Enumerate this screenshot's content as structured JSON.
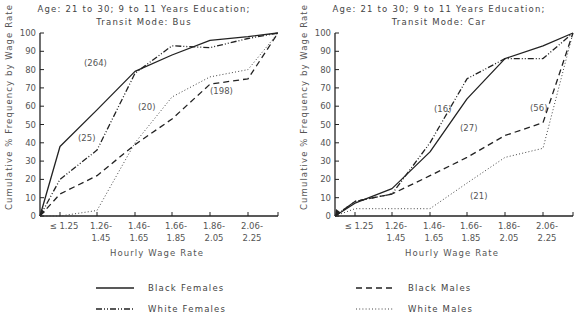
{
  "chart_data": [
    {
      "type": "line",
      "title": "Age: 21 to 30; 9 to 11 Years Education; Transit Mode: Bus",
      "title_lines": [
        "Age: 21 to 30; 9 to 11 Years Education;",
        "Transit Mode: Bus"
      ],
      "xlabel": "Hourly Wage Rate",
      "ylabel": "Cumulative % Frequency by Wage Rate",
      "categories": [
        "≤ 1.25",
        "1.26-1.45",
        "1.46-1.65",
        "1.66-1.85",
        "1.86-2.05",
        "2.06-2.25"
      ],
      "tick_labels": [
        [
          "≤ 1.25",
          ""
        ],
        [
          "1.26-",
          "1.45"
        ],
        [
          "1.46-",
          "1.65"
        ],
        [
          "1.66-",
          "1.85"
        ],
        [
          "1.86-",
          "2.05"
        ],
        [
          "2.06-",
          "2.25"
        ]
      ],
      "point_positions": [
        "origin",
        "≤ 1.25",
        "1.26-1.45",
        "1.46-1.65",
        "1.66-1.85",
        "1.86-2.05",
        "2.06-2.25",
        "end"
      ],
      "note": "Each series has 8 points: an origin at 0%, one per category, and a terminal point at 100%.",
      "ylim": [
        0,
        100
      ],
      "yticks": [
        0,
        10,
        20,
        30,
        40,
        50,
        60,
        70,
        80,
        90,
        100
      ],
      "grid": false,
      "legend_position": "bottom",
      "series": [
        {
          "name": "Black Females",
          "style": "solid",
          "values": [
            0,
            38,
            58,
            79,
            88,
            96,
            98,
            100
          ]
        },
        {
          "name": "White Females",
          "style": "dashdot",
          "values": [
            0,
            20,
            36,
            78,
            93,
            92,
            97,
            100
          ]
        },
        {
          "name": "Black Males",
          "style": "dashed",
          "values": [
            0,
            12,
            22,
            39,
            53,
            72,
            75,
            100
          ]
        },
        {
          "name": "White Males",
          "style": "dotted",
          "values": [
            0,
            0,
            3,
            40,
            65,
            76,
            80,
            100
          ]
        }
      ],
      "annotations": [
        {
          "text": "(264)",
          "series": "Black Females",
          "x": 84,
          "y": 66
        },
        {
          "text": "(25)",
          "series": "White Females",
          "x": 78,
          "y": 141
        },
        {
          "text": "(20)",
          "series": "White Males",
          "x": 138,
          "y": 110
        },
        {
          "text": "(198)",
          "series": "Black Males",
          "x": 210,
          "y": 94
        }
      ]
    },
    {
      "type": "line",
      "title": "Age: 21 to 30; 9 to 11 Years Education; Transit Mode: Car",
      "title_lines": [
        "Age: 21 to 30; 9 to 11 Years Education;",
        "Transit Mode: Car"
      ],
      "xlabel": "Hourly Wage Rate",
      "ylabel": "Cumulative % Frequency by Wage Rate",
      "categories": [
        "≤ 1.25",
        "1.26-1.45",
        "1.46-1.65",
        "1.66-1.85",
        "1.86-2.05",
        "2.06-2.25"
      ],
      "tick_labels": [
        [
          "≤ 1.25",
          ""
        ],
        [
          "1.26-",
          "1.45"
        ],
        [
          "1.46-",
          "1.65"
        ],
        [
          "1.66-",
          "1.85"
        ],
        [
          "1.86-",
          "2.05"
        ],
        [
          "2.06-",
          "2.25"
        ]
      ],
      "point_positions": [
        "origin",
        "≤ 1.25",
        "1.26-1.45",
        "1.46-1.65",
        "1.66-1.85",
        "1.86-2.05",
        "2.06-2.25",
        "end"
      ],
      "note": "Each series has 8 points: an origin at 0%, one per category, and a terminal point at 100%.",
      "ylim": [
        0,
        100
      ],
      "yticks": [
        0,
        10,
        20,
        30,
        40,
        50,
        60,
        70,
        80,
        90,
        100
      ],
      "grid": false,
      "legend_position": "bottom",
      "series": [
        {
          "name": "Black Females",
          "style": "solid",
          "values": [
            0,
            7,
            15,
            35,
            64,
            86,
            93,
            100
          ]
        },
        {
          "name": "White Females",
          "style": "dashdot",
          "values": [
            0,
            8,
            12,
            40,
            75,
            86,
            86,
            100
          ]
        },
        {
          "name": "Black Males",
          "style": "dashed",
          "values": [
            0,
            8,
            12,
            22,
            32,
            44,
            51,
            100
          ]
        },
        {
          "name": "White Males",
          "style": "dotted",
          "values": [
            0,
            4,
            4,
            4,
            18,
            32,
            37,
            100
          ]
        }
      ],
      "annotations": [
        {
          "text": "(16)",
          "series": "White Females",
          "x": 434,
          "y": 112
        },
        {
          "text": "(27)",
          "series": "Black Females",
          "x": 460,
          "y": 131
        },
        {
          "text": "(56)",
          "series": "Black Males",
          "x": 530,
          "y": 111
        },
        {
          "text": "(21)",
          "series": "White Males",
          "x": 470,
          "y": 199
        }
      ]
    }
  ],
  "legend": {
    "items": [
      {
        "label": "Black Females",
        "style": "solid"
      },
      {
        "label": "White Females",
        "style": "dashdot"
      },
      {
        "label": "Black Males",
        "style": "dashed"
      },
      {
        "label": "White Males",
        "style": "dotted"
      }
    ]
  }
}
